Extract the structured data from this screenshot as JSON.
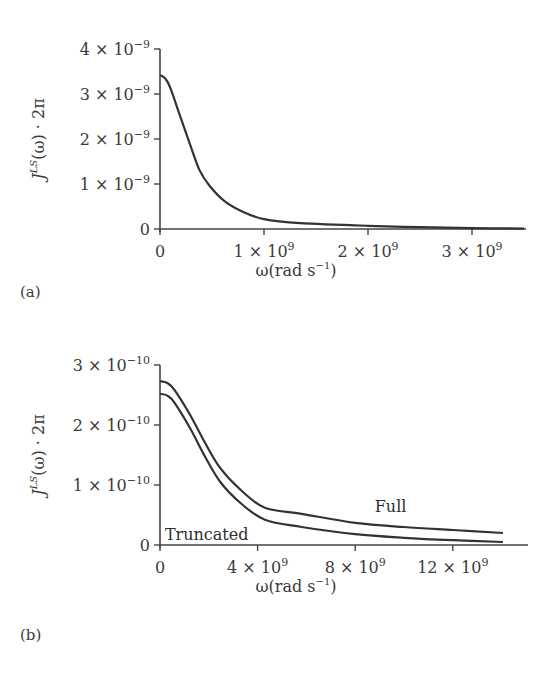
{
  "chart_data": [
    {
      "panel": "(a)",
      "type": "line",
      "title": "",
      "xlabel": "ω(rad s⁻¹)",
      "xlabel_parts": {
        "base": "ω(rad s",
        "sup": "−1",
        "tail": ")"
      },
      "ylabel": "J^LS(ω) · 2π",
      "ylabel_parts": {
        "J": "J",
        "sup": "LS",
        "rest": "(ω) · 2π"
      },
      "xlim": [
        0,
        3500000000.0
      ],
      "ylim": [
        0,
        4e-09
      ],
      "grid": false,
      "x_ticks": [
        {
          "value": 0,
          "mant": "0",
          "exp": ""
        },
        {
          "value": 1000000000.0,
          "mant": "1 × 10",
          "exp": "9"
        },
        {
          "value": 2000000000.0,
          "mant": "2 × 10",
          "exp": "9"
        },
        {
          "value": 3000000000.0,
          "mant": "3 × 10",
          "exp": "9"
        }
      ],
      "y_ticks": [
        {
          "value": 0,
          "mant": "0",
          "exp": ""
        },
        {
          "value": 1e-09,
          "mant": "1 × 10",
          "exp": "−9"
        },
        {
          "value": 2e-09,
          "mant": "2 × 10",
          "exp": "−9"
        },
        {
          "value": 3e-09,
          "mant": "3 × 10",
          "exp": "−9"
        },
        {
          "value": 4e-09,
          "mant": "4 × 10",
          "exp": "−9"
        }
      ],
      "series": [
        {
          "name": "J^LS",
          "x": [
            0,
            50000000.0,
            100000000.0,
            190000000.0,
            290000000.0,
            380000000.0,
            480000000.0,
            620000000.0,
            800000000.0,
            1000000000.0,
            1350000000.0,
            2000000000.0,
            2500000000.0,
            3000000000.0,
            3500000000.0
          ],
          "y": [
            3.42e-09,
            3.35e-09,
            3.13e-09,
            2.53e-09,
            1.87e-09,
            1.31e-09,
            9.5e-10,
            6.2e-10,
            3.8e-10,
            2.2e-10,
            1.3e-10,
            7e-11,
            4e-11,
            2e-11,
            1e-11
          ]
        }
      ],
      "annotations": []
    },
    {
      "panel": "(b)",
      "type": "line",
      "title": "",
      "xlabel": "ω(rad s⁻¹)",
      "xlabel_parts": {
        "base": "ω(rad s",
        "sup": "−1",
        "tail": ")"
      },
      "ylabel": "J^LS(ω) · 2π",
      "ylabel_parts": {
        "J": "J",
        "sup": "LS",
        "rest": "(ω) · 2π"
      },
      "xlim": [
        0,
        15000000000.0
      ],
      "ylim": [
        0,
        3e-10
      ],
      "grid": false,
      "x_ticks": [
        {
          "value": 0,
          "mant": "0",
          "exp": ""
        },
        {
          "value": 4000000000.0,
          "mant": "4 × 10",
          "exp": "9"
        },
        {
          "value": 8000000000.0,
          "mant": "8 × 10",
          "exp": "9"
        },
        {
          "value": 12000000000.0,
          "mant": "12 × 10",
          "exp": "9"
        }
      ],
      "y_ticks": [
        {
          "value": 0,
          "mant": "0",
          "exp": ""
        },
        {
          "value": 1e-10,
          "mant": "1 × 10",
          "exp": "−10"
        },
        {
          "value": 2e-10,
          "mant": "2 × 10",
          "exp": "−10"
        },
        {
          "value": 3e-10,
          "mant": "3 × 10",
          "exp": "−10"
        }
      ],
      "series": [
        {
          "name": "Full",
          "x": [
            0,
            300000000.0,
            600000000.0,
            1230000000.0,
            1850000000.0,
            2470000000.0,
            3300000000.0,
            4300000000.0,
            5800000000.0,
            8000000000.0,
            10000000000.0,
            12000000000.0,
            14100000000.0
          ],
          "y": [
            2.73e-10,
            2.7e-10,
            2.58e-10,
            2.17e-10,
            1.7e-10,
            1.28e-10,
            9.2e-11,
            6.2e-11,
            5.2e-11,
            3.7e-11,
            3e-11,
            2.5e-11,
            2e-11
          ]
        },
        {
          "name": "Truncated",
          "x": [
            0,
            300000000.0,
            600000000.0,
            1230000000.0,
            1850000000.0,
            2470000000.0,
            3300000000.0,
            4300000000.0,
            5800000000.0,
            8000000000.0,
            10000000000.0,
            12000000000.0,
            14100000000.0
          ],
          "y": [
            2.52e-10,
            2.49e-10,
            2.37e-10,
            1.95e-10,
            1.47e-10,
            1.05e-10,
            7e-11,
            4.2e-11,
            3e-11,
            1.8e-11,
            1.2e-11,
            8e-12,
            5e-12
          ]
        }
      ],
      "annotations": [
        {
          "text": "Full",
          "series": "Full",
          "x": 8800000000.0,
          "y": 5.5e-11
        },
        {
          "text": "Truncated",
          "series": "Truncated",
          "x": 200000000.0,
          "y": 8e-12
        }
      ]
    }
  ]
}
